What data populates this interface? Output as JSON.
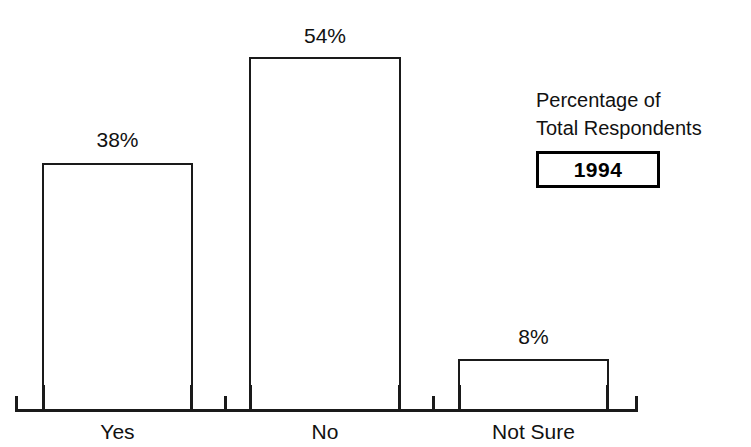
{
  "chart_data": {
    "type": "bar",
    "title": "",
    "subtitle": "",
    "xlabel": "",
    "ylabel": "",
    "categories": [
      "Yes",
      "No",
      "Not Sure"
    ],
    "values": [
      38,
      54,
      8
    ],
    "data_labels": [
      "38%",
      "54%",
      "8%"
    ],
    "ylim": [
      0,
      60
    ],
    "grid": false,
    "legend_position": "right",
    "bar_style": {
      "fill": "#ffffff",
      "border": "#1a1a1a"
    },
    "annotations": {
      "legend_line_1": "Percentage of",
      "legend_line_2": "Total Respondents",
      "legend_year": "1994"
    }
  },
  "legend": {
    "line1": "Percentage of",
    "line2": "Total Respondents",
    "year": "1994"
  },
  "axis": {
    "categories": [
      {
        "label": "Yes"
      },
      {
        "label": "No"
      },
      {
        "label": "Not Sure"
      }
    ]
  },
  "bars": [
    {
      "label": "Yes",
      "value": 38,
      "display": "38%"
    },
    {
      "label": "No",
      "value": 54,
      "display": "54%"
    },
    {
      "label": "Not Sure",
      "value": 8,
      "display": "8%"
    }
  ],
  "colors": {
    "background": "#ffffff",
    "ink": "#111111",
    "bar_outline": "#1a1a1a",
    "bar_fill": "#ffffff",
    "axis": "#1a1a1a"
  }
}
